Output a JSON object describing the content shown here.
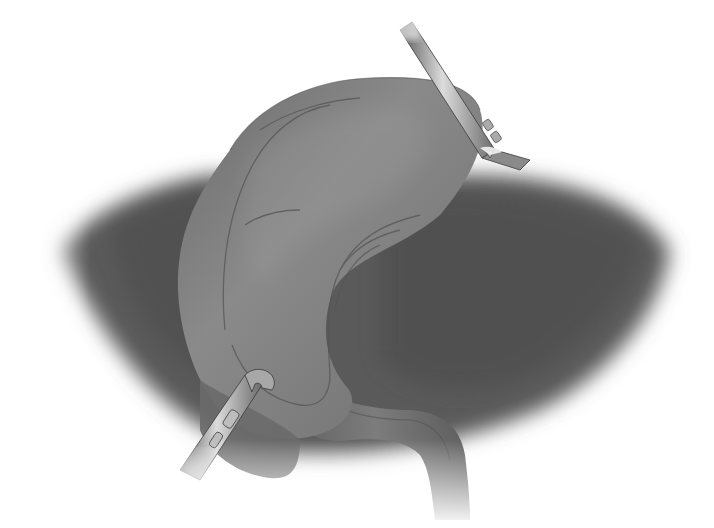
{
  "illustration": {
    "subject": "Laparoscopic cholecystectomy: gallbladder fundus retracted cephalad over liver, infundibulum retracted laterally",
    "style": "grayscale airbrush medical illustration",
    "background_color": "#ffffff",
    "colors": {
      "liver": "#6e6e6e",
      "liver_dark": "#4a4a4a",
      "gallbladder": "#7a7a7a",
      "gallbladder_highlight": "#8e8e8e",
      "vessel_line": "#5a5a5a",
      "instrument": "#8a8a8a",
      "instrument_highlight": "#d8d8d8",
      "instrument_edge": "#3a3a3a"
    },
    "elements": [
      {
        "name": "liver",
        "description": "large dark lobes fading to white at edges"
      },
      {
        "name": "gallbladder",
        "description": "curved organ lifted over liver with visible cystic artery branches"
      },
      {
        "name": "cystic-duct",
        "description": "tubular neck curving down to lower right"
      },
      {
        "name": "upper-grasper",
        "description": "laparoscopic grasper holding fundus at upper right"
      },
      {
        "name": "lower-grasper",
        "description": "laparoscopic grasper holding infundibulum at lower left"
      }
    ]
  }
}
